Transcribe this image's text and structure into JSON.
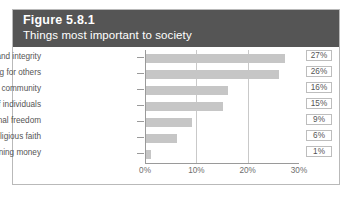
{
  "figure": {
    "number": "Figure 5.8.1",
    "subtitle": "Things most important to society",
    "header_bg": "#555555",
    "header_text_color": "#ffffff",
    "frame_border_color": "#b9b9b9",
    "bar_color": "#c6c6c6",
    "gridline_color": "#c9c9c9",
    "axis_color": "#9a9a9a",
    "label_color": "#555555"
  },
  "chart_data": {
    "type": "bar",
    "orientation": "horizontal",
    "title": "Figure 5.8.1",
    "subtitle": "Things most important to society",
    "xlabel": "",
    "ylabel": "",
    "categories": [
      "Own honesty and integrity",
      "Caring for others",
      "Sense of community",
      "Value of individuals",
      "Personal freedom",
      "Religious faith",
      "Gaining money"
    ],
    "values": [
      27,
      26,
      16,
      15,
      9,
      6,
      1
    ],
    "value_labels": [
      "27%",
      "26%",
      "16%",
      "15%",
      "9%",
      "6%",
      "1%"
    ],
    "xlim": [
      0,
      30
    ],
    "xticks": [
      0,
      10,
      20,
      30
    ],
    "xtick_labels": [
      "0%",
      "10%",
      "20%",
      "30%"
    ],
    "grid": "vertical",
    "gridlines_at": [
      10,
      20
    ],
    "legend": "none",
    "value_labels_position": "right-boxed"
  }
}
